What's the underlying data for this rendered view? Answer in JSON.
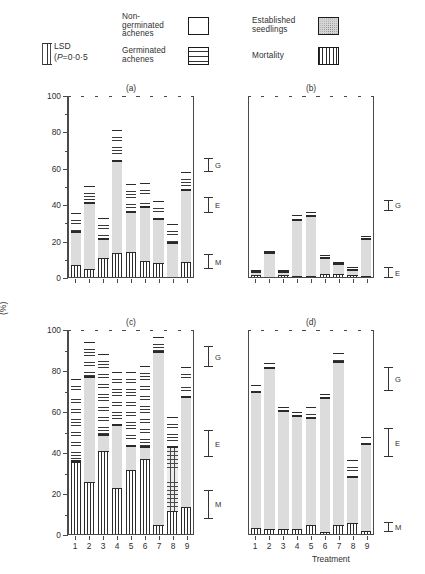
{
  "legend": {
    "items": [
      {
        "label": "Non-\ngerminated\nachenes",
        "pattern": "empty",
        "name": "non-germinated-achenes"
      },
      {
        "label": "Germinated\nachenes",
        "pattern": "horizontal-dashes",
        "name": "germinated-achenes"
      },
      {
        "label": "Established\nseedlings",
        "pattern": "stipple",
        "name": "established-seedlings"
      },
      {
        "label": "Mortality",
        "pattern": "vertical-lines",
        "name": "mortality"
      }
    ],
    "lsd_line1": "LSD",
    "lsd_line2_pre": "(",
    "lsd_line2_italic": "P",
    "lsd_line2_post": "=0·0·5"
  },
  "axes": {
    "ylabel": "(%)",
    "xlabel": "Treatment",
    "yticks": [
      0,
      20,
      40,
      60,
      80,
      100
    ],
    "ylim": [
      0,
      100
    ],
    "xticklabels": [
      "1",
      "2",
      "3",
      "4",
      "5",
      "6",
      "7",
      "8",
      "9"
    ]
  },
  "lsd_marks": {
    "G": "G",
    "E": "E",
    "M": "M"
  },
  "chart_data": {
    "type": "bar",
    "title": "",
    "subplots": 4,
    "stacked": true,
    "stack_order": [
      "mortality",
      "established",
      "germinated",
      "non_germinated"
    ],
    "series_names": [
      "Mortality",
      "Established seedlings",
      "Germinated achenes",
      "Non-germinated achenes"
    ],
    "categories": [
      "1",
      "2",
      "3",
      "4",
      "5",
      "6",
      "7",
      "8",
      "9"
    ],
    "xlabel": "Treatment",
    "ylabel": "(%)",
    "ylim": [
      0,
      100
    ],
    "grid": false,
    "panels": [
      {
        "label": "(a)",
        "mortality": [
          6.5,
          4.5,
          10.5,
          13.0,
          14.0,
          9.0,
          7.5,
          0.0,
          8.0
        ],
        "established": [
          18.5,
          36.0,
          10.5,
          50.5,
          21.5,
          29.5,
          24.5,
          18.5,
          40.0
        ],
        "germinated": [
          10.0,
          9.5,
          11.5,
          17.5,
          15.5,
          13.0,
          10.0,
          10.5,
          9.5
        ],
        "non_germinated": [
          65.0,
          50.0,
          67.5,
          19.0,
          49.0,
          48.5,
          58.0,
          71.0,
          42.5
        ],
        "lsd": {
          "G": {
            "center": 62.0,
            "half": 4.0
          },
          "E": {
            "center": 40.0,
            "half": 4.5
          },
          "M": {
            "center": 9.0,
            "half": 4.0
          }
        }
      },
      {
        "label": "(b)",
        "mortality": [
          1.2,
          0.0,
          1.0,
          0.5,
          0.8,
          1.5,
          1.5,
          1.0,
          0.8
        ],
        "established": [
          1.5,
          13.0,
          1.5,
          31.0,
          32.5,
          9.0,
          5.5,
          3.0,
          20.0
        ],
        "germinated": [
          1.3,
          1.5,
          1.5,
          2.5,
          2.5,
          1.5,
          1.5,
          1.5,
          1.7
        ],
        "non_germinated": [
          96.0,
          85.5,
          96.0,
          66.0,
          64.2,
          88.0,
          91.5,
          94.5,
          77.5
        ],
        "lsd": {
          "G": {
            "center": 40.0,
            "half": 3.0
          },
          "E": {
            "center": 3.0,
            "half": 3.0
          }
        }
      },
      {
        "label": "(c)",
        "mortality": [
          35.0,
          25.5,
          40.5,
          22.5,
          31.0,
          36.5,
          4.5,
          11.0,
          13.0
        ],
        "established": [
          0.5,
          51.0,
          8.0,
          30.5,
          12.0,
          6.0,
          84.5,
          31.5,
          54.0
        ],
        "germinated": [
          40.0,
          17.0,
          39.5,
          26.0,
          36.0,
          39.5,
          7.0,
          14.5,
          14.5
        ],
        "non_germinated": [
          24.5,
          6.5,
          12.0,
          21.0,
          21.0,
          18.0,
          4.0,
          43.0,
          18.5
        ],
        "lsd": {
          "G": {
            "center": 87.0,
            "half": 5.0
          },
          "E": {
            "center": 44.5,
            "half": 6.5
          },
          "M": {
            "center": 15.0,
            "half": 7.0
          }
        }
      },
      {
        "label": "(d)",
        "mortality": [
          3.0,
          2.5,
          2.5,
          2.5,
          4.5,
          1.0,
          4.5,
          5.5,
          1.5
        ],
        "established": [
          66.5,
          78.5,
          57.5,
          55.0,
          52.0,
          65.5,
          79.5,
          22.5,
          42.5
        ],
        "germinated": [
          3.0,
          2.5,
          2.0,
          2.0,
          5.5,
          2.0,
          4.5,
          8.0,
          3.5
        ],
        "non_germinated": [
          27.5,
          16.5,
          38.0,
          40.5,
          38.0,
          31.5,
          11.5,
          64.0,
          52.5
        ],
        "lsd": {
          "G": {
            "center": 76.0,
            "half": 6.0
          },
          "E": {
            "center": 45.0,
            "half": 7.0
          },
          "M": {
            "center": 4.0,
            "half": 2.5
          }
        }
      }
    ]
  }
}
